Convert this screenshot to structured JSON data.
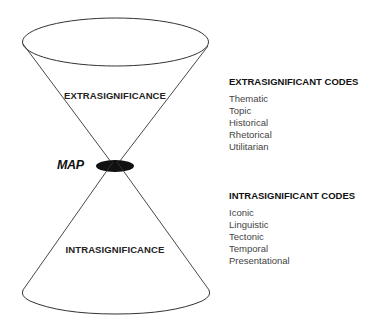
{
  "diagram": {
    "upper_cone_label": "EXTRASIGNIFICANCE",
    "lower_cone_label": "INTRASIGNIFICANCE",
    "apex_label": "MAP"
  },
  "extrasignificant": {
    "heading": "EXTRASIGNIFICANT CODES",
    "items": [
      "Thematic",
      "Topic",
      "Historical",
      "Rhetorical",
      "Utilitarian"
    ]
  },
  "intrasignificant": {
    "heading": "INTRASIGNIFICANT CODES",
    "items": [
      "Iconic",
      "Linguistic",
      "Tectonic",
      "Temporal",
      "Presentational"
    ]
  }
}
